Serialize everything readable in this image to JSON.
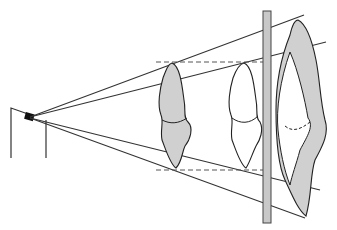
{
  "diagram": {
    "colors": {
      "stroke": "#222222",
      "bone_fill": "#d0d0d0",
      "plate_fill": "#c8c8c8",
      "background": "#ffffff"
    },
    "elements": [
      {
        "name": "x-ray-source",
        "description": "Point source on a stand, left"
      },
      {
        "name": "beam-rays",
        "description": "Four diverging rays from source"
      },
      {
        "name": "object-shaded",
        "description": "Shaded bone/joint silhouette near source"
      },
      {
        "name": "object-outline",
        "description": "Unshaded bone/joint outline"
      },
      {
        "name": "detector-plate",
        "description": "Vertical gray plate / film"
      },
      {
        "name": "magnified-projection",
        "description": "Enlarged projected image with shaded margin"
      },
      {
        "name": "dashed-guides",
        "description": "Horizontal dashed lines marking object extent"
      }
    ]
  }
}
